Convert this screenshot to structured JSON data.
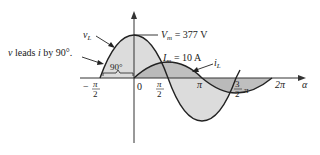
{
  "diagram": {
    "labels": {
      "vL": "v",
      "vL_sub": "L",
      "iL": "i",
      "iL_sub": "L",
      "lead_text": "v leads i by 90°.",
      "lead_v": "v",
      "lead_mid": " leads ",
      "lead_i": "i",
      "lead_end": " by 90°.",
      "angle": "90°",
      "Vm_sym": "V",
      "Vm_sub": "m",
      "Vm_val": " = 377 V",
      "Im_sym": "I",
      "Im_sub": "m",
      "Im_val": " = 10 A",
      "alpha": "α"
    },
    "ticks": {
      "neg_half_pi_sign": "−",
      "pi": "π",
      "two": "2",
      "three": "3",
      "zero": "0",
      "two_pi": "2π"
    },
    "colors": {
      "axis": "#333333",
      "curve": "#222222",
      "vL_fill": "#dcdcdc",
      "iL_fill": "#b8b8b8"
    }
  }
}
